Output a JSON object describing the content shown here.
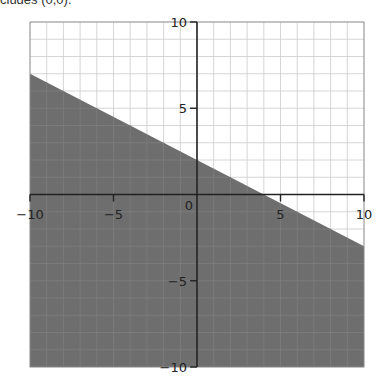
{
  "caption": "cludes (0,0).",
  "colors": {
    "shade": "#6e6e6e",
    "grid_light": "#cccccc",
    "grid_on_shade": "#7d7d7d",
    "axis": "#222222",
    "border": "#888888"
  },
  "chart_data": {
    "type": "area",
    "title": "",
    "xlabel": "",
    "ylabel": "",
    "xlim": [
      -10,
      10
    ],
    "ylim": [
      -10,
      10
    ],
    "grid": true,
    "grid_step": 1,
    "x_ticks": [
      -10,
      -5,
      0,
      5,
      10
    ],
    "y_ticks": [
      -10,
      -5,
      5,
      10
    ],
    "x_tick_labels": [
      "−10",
      "−5",
      "0",
      "5",
      "10"
    ],
    "y_tick_labels": [
      "−10",
      "−5",
      "5",
      "10"
    ],
    "boundary_line": {
      "equation": "y = -0.5x + 2",
      "slope": -0.5,
      "intercept": 2,
      "points": [
        [
          -10,
          7
        ],
        [
          0,
          2
        ],
        [
          4,
          0
        ],
        [
          10,
          -3
        ]
      ]
    },
    "inequality": "y <= -0.5x + 2",
    "shaded_region": "below line",
    "legend": null
  }
}
